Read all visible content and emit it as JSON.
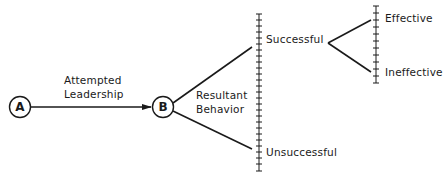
{
  "diagram": {
    "type": "leadership-outcome-tree",
    "nodes": {
      "a": {
        "label": "A"
      },
      "b": {
        "label": "B"
      }
    },
    "edges": {
      "a_to_b": {
        "label_line1": "Attempted",
        "label_line2": "Leadership"
      },
      "b_branches": {
        "label_line1": "Resultant",
        "label_line2": "Behavior"
      }
    },
    "outcomes": {
      "successful": "Successful",
      "unsuccessful": "Unsuccessful",
      "effective": "Effective",
      "ineffective": "Ineffective"
    },
    "colors": {
      "ink": "#1a1a1a",
      "background": "#ffffff"
    }
  }
}
